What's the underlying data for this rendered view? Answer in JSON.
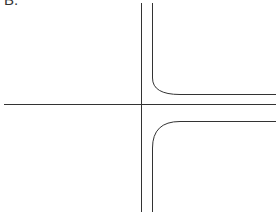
{
  "figure": {
    "label": "B.",
    "stroke_color": "#333333",
    "background": "#ffffff",
    "elements": {
      "horizontal_center_line": {
        "x1": 4,
        "y1": 104,
        "x2": 276,
        "y2": 104
      },
      "vertical_left_line": {
        "x1": 141,
        "y1": 3,
        "x2": 141,
        "y2": 212
      },
      "vertical_right_upper": {
        "x1": 152,
        "y1": 3,
        "x2": 152,
        "y2": 78
      },
      "upper_branch_edge": {
        "y": 94,
        "x_start": 180,
        "x_end": 276,
        "corner_radius": 17
      },
      "lower_branch_edge": {
        "y": 121,
        "x_start": 180,
        "x_end": 276,
        "corner_radius": 27
      },
      "vertical_right_lower": {
        "x1": 152,
        "y1": 148,
        "x2": 152,
        "y2": 212
      }
    }
  }
}
